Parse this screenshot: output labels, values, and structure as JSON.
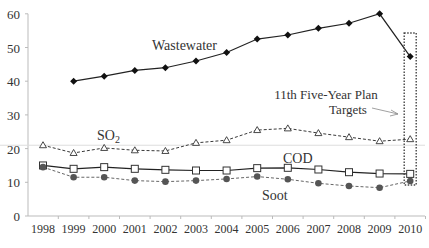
{
  "chart_data": {
    "type": "line",
    "title": "",
    "xlabel": "",
    "ylabel": "",
    "ylim": [
      0,
      60
    ],
    "yticks": [
      0,
      10,
      20,
      30,
      40,
      50,
      60
    ],
    "categories": [
      "1998",
      "1999",
      "2000",
      "2001",
      "2002",
      "2003",
      "2004",
      "2005",
      "2006",
      "2007",
      "2008",
      "2009",
      "2010"
    ],
    "grid": false,
    "reference_line": 21,
    "series": [
      {
        "name": "Wastewater",
        "marker": "diamond",
        "line": "solid",
        "values": [
          null,
          40.0,
          41.5,
          43.2,
          44.0,
          46.0,
          48.5,
          52.5,
          53.7,
          55.7,
          57.2,
          60.0,
          47.3
        ]
      },
      {
        "name": "SO2",
        "marker": "triangle-open",
        "line": "dashed",
        "values": [
          21.0,
          18.7,
          20.2,
          19.5,
          19.3,
          21.7,
          22.5,
          25.5,
          26.0,
          24.6,
          23.4,
          22.2,
          22.8
        ]
      },
      {
        "name": "COD",
        "marker": "square-open",
        "line": "solid",
        "values": [
          15.0,
          14.0,
          14.5,
          14.0,
          13.7,
          13.5,
          13.5,
          14.2,
          14.3,
          13.8,
          13.0,
          12.6,
          12.5
        ]
      },
      {
        "name": "Soot",
        "marker": "circle",
        "line": "dashed",
        "values": [
          14.5,
          11.5,
          11.5,
          10.5,
          10.2,
          10.5,
          11.0,
          11.7,
          10.9,
          9.7,
          8.9,
          8.4,
          10.4
        ]
      }
    ],
    "annotations": [
      {
        "text_line1": "11th Five-Year Plan",
        "text_line2": "Targets",
        "target": "2010",
        "style": "dotted-box-with-arrow"
      }
    ],
    "series_labels": {
      "wastewater": "Wastewater",
      "so2_main": "SO",
      "so2_sub": "2",
      "cod": "COD",
      "soot": "Soot"
    },
    "legend": "inline labels"
  }
}
